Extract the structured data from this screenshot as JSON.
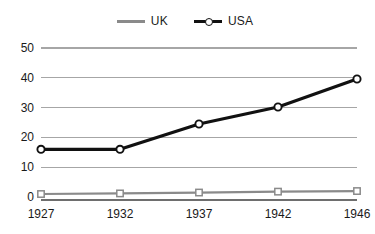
{
  "chart_data": {
    "type": "line",
    "title": "",
    "subtitle": "",
    "xlabel": "",
    "ylabel": "",
    "categories": [
      "1927",
      "1932",
      "1937",
      "1942",
      "1946"
    ],
    "x": [
      1927,
      1932,
      1937,
      1942,
      1946
    ],
    "series": [
      {
        "name": "UK",
        "values": [
          1.0,
          1.2,
          1.5,
          1.8,
          2.0
        ],
        "color": "#8a8a8a",
        "marker": "open-square"
      },
      {
        "name": "USA",
        "values": [
          16.0,
          16.0,
          24.5,
          30.2,
          39.6
        ],
        "color": "#111111",
        "marker": "open-circle"
      }
    ],
    "yticks": [
      0,
      10,
      20,
      30,
      40,
      50
    ],
    "ylim": [
      0,
      50
    ],
    "xlim": [
      1927,
      1946
    ],
    "grid": "horizontal",
    "legend_position": "top-center"
  },
  "legend": {
    "entries": [
      {
        "label": "UK"
      },
      {
        "label": "USA"
      }
    ]
  },
  "axes": {
    "y_tick_labels": [
      "50",
      "40",
      "30",
      "20",
      "10",
      "0"
    ],
    "x_tick_labels": [
      "1927",
      "1932",
      "1937",
      "1942",
      "1946"
    ]
  },
  "colors": {
    "uk_line": "#8a8a8a",
    "usa_line": "#111111",
    "gridline": "#a6a6a6",
    "baseline": "#6e6e6e",
    "background": "#ffffff",
    "text": "#1a1a1a"
  }
}
